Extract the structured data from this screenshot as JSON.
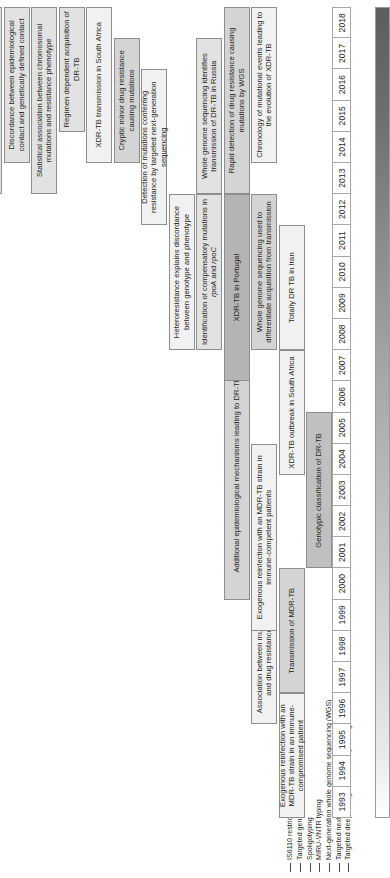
{
  "figure": {
    "orientation": "rotated-90-ccw"
  },
  "axis": {
    "label": "Year",
    "years": [
      "1993",
      "1994",
      "1995",
      "1996",
      "1997",
      "1998",
      "1999",
      "2000",
      "2001",
      "2002",
      "2003",
      "2004",
      "2005",
      "2006",
      "2007",
      "2008",
      "2009",
      "2010",
      "2011",
      "2012",
      "2013",
      "2014",
      "2015",
      "2016",
      "2017",
      "2018"
    ],
    "gradient_from": "#ffffff",
    "gradient_to": "#5d5d5d"
  },
  "legend": {
    "items": [
      {
        "label": "IS6110 restriction fragment length polymorphism",
        "color": "#4a4a4a"
      },
      {
        "label": "Targeted gene sequencing",
        "color": "#4a4a4a"
      },
      {
        "label": "Spoligotyping",
        "color": "#4a4a4a"
      },
      {
        "label": "MIRU-VNTR typing",
        "color": "#4a4a4a"
      },
      {
        "label": "Next-generation whole genome sequencing (WGS)",
        "color": "#4a4a4a"
      },
      {
        "label": "Targeted next-generation sequencing",
        "color": "#4a4a4a"
      },
      {
        "label": "Targeted deep next-generation sequencing",
        "color": "#4a4a4a"
      }
    ]
  },
  "events": [
    {
      "id": "exogenous-reinfection-immunocompromised",
      "label": "Exogenous reinfection with an MDR-TB strain in an immune-compromised patient",
      "start_year": "1993",
      "end_year": "1996",
      "lane": 1,
      "tone": "t-light"
    },
    {
      "id": "association-mutation-drug-resistance",
      "label": "Association between mutation and drug resistance",
      "start_year": "1996",
      "end_year": "1999",
      "lane": 2,
      "tone": "t-light"
    },
    {
      "id": "transmission-of-mdr-tb",
      "label": "Transmission of MDR-TB",
      "start_year": "1997",
      "end_year": "2000",
      "lane": 1,
      "tone": "t-mid2"
    },
    {
      "id": "exogenous-reinfection-immunocompetent",
      "label": "Exogenous reinfection with an MDR-TB strain in immune-competent patients",
      "start_year": "1999",
      "end_year": "2004",
      "lane": 2,
      "tone": "t-light"
    },
    {
      "id": "genotypic-classification-dr-tb",
      "label": "Genotypic classification of DR-TB",
      "start_year": "2001",
      "end_year": "2005",
      "lane": 0,
      "tone": "t-dark"
    },
    {
      "id": "additional-epidemiological-mechanisms",
      "label": "Additional epidemiological mechanisms leading to DR-TB",
      "start_year": "2000",
      "end_year": "2007",
      "lane": 3,
      "tone": "t-mid2"
    },
    {
      "id": "xdr-tb-outbreak-south-africa",
      "label": "XDR-TB outbreak in South Africa",
      "start_year": "2004",
      "end_year": "2007",
      "lane": 1,
      "tone": "t-light"
    },
    {
      "id": "totally-dr-tb-iran",
      "label": "Totally DR TB in Iran",
      "start_year": "2008",
      "end_year": "2011",
      "lane": 1,
      "tone": "t-light"
    },
    {
      "id": "xdr-tb-portugal",
      "label": "XDR-TB in Portugal",
      "start_year": "2007",
      "end_year": "2012",
      "lane": 3,
      "tone": "t-dark2"
    },
    {
      "id": "wgs-differentiate-acquisition-transmission",
      "label": "Whole genome sequencing used to differentiate acquisition from transmission",
      "start_year": "2008",
      "end_year": "2012",
      "lane": 2,
      "tone": "t-mid2"
    },
    {
      "id": "identification-compensatory-mutations",
      "label": "Identification of compensatory mutations in rpoA and rpoC",
      "start_year": "2008",
      "end_year": "2012",
      "lane": 4,
      "tone": "t-mid"
    },
    {
      "id": "heteroresistance-explains-discordance",
      "label": "Heteroresistance explains discordance between genotype and phenotype",
      "start_year": "2008",
      "end_year": "2012",
      "lane": 5,
      "tone": "t-light"
    },
    {
      "id": "detection-mutations-targeted-ngs",
      "label": "Detection of mutations conferring resistance by targeted next-generation sequencing",
      "start_year": "2012",
      "end_year": "2016",
      "lane": 6,
      "tone": "t-light"
    },
    {
      "id": "wgs-transmission-dr-tb-russia",
      "label": "Whole genome sequencing identifies transmission of DR-TB in Russia",
      "start_year": "2013",
      "end_year": "2017",
      "lane": 4,
      "tone": "t-mid"
    },
    {
      "id": "rapid-detection-drug-resistance-wgs",
      "label": "Rapid detection of drug resistance causing mutations by WGS",
      "start_year": "2013",
      "end_year": "2018",
      "lane": 3,
      "tone": "t-mid2"
    },
    {
      "id": "chronology-mutational-events-xdr",
      "label": "Chronology of mutational events leading to the evolution of XDR-TB",
      "start_year": "2014",
      "end_year": "2018",
      "lane": 2,
      "tone": "t-light"
    },
    {
      "id": "cryptic-minor-drug-resistance",
      "label": "Cryptic minor drug resistance causing mutations",
      "start_year": "2014",
      "end_year": "2017",
      "lane": 7,
      "tone": "t-mid2"
    },
    {
      "id": "xdr-tb-transmission-south-africa",
      "label": "XDR-TB transmission in South Africa",
      "start_year": "2014",
      "end_year": "2018",
      "lane": 8,
      "tone": "t-light"
    },
    {
      "id": "regimen-dependent-acquisition",
      "label": "Regimen dependent acquisition of DR-TB",
      "start_year": "2015",
      "end_year": "2018",
      "lane": 9,
      "tone": "t-mid"
    },
    {
      "id": "statistical-association-chromosomal",
      "label": "Statistical association between chromosomal mutations and resistance phenotype",
      "start_year": "2013",
      "end_year": "2018",
      "lane": 10,
      "tone": "t-mid"
    },
    {
      "id": "discordance-epidemiological-genetic-contact",
      "label": "Discordance between epidemiological contact and genetically defined contact",
      "start_year": "2014",
      "end_year": "2018",
      "lane": 11,
      "tone": "t-mid"
    },
    {
      "id": "online-ngs-analysis-tools",
      "label": "Online next-generation sequencing analysis tools for lineage and DR prediction",
      "start_year": "2013",
      "end_year": "2018",
      "lane": 12,
      "tone": "t-mid"
    }
  ]
}
